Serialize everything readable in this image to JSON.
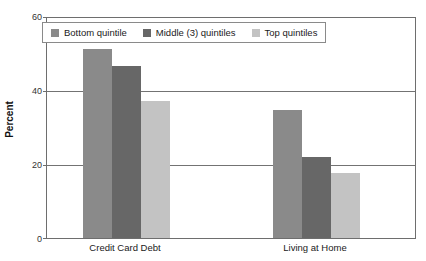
{
  "chart_data": {
    "type": "bar",
    "title": "",
    "subtitle": "",
    "xlabel": "",
    "ylabel": "Percent",
    "ylim": [
      0,
      60
    ],
    "yticks": [
      0,
      20,
      40,
      60
    ],
    "ytick_labels": [
      "0",
      "20",
      "40",
      "60"
    ],
    "grid": true,
    "grid_axis": "y",
    "legend_position": "upper left",
    "categories": [
      "Credit Card Debt",
      "Living at Home"
    ],
    "series": [
      {
        "name": "Bottom quintile",
        "color": "#8a8a8a",
        "values": [
          51,
          34.5
        ]
      },
      {
        "name": "Middle (3) quintiles",
        "color": "#676767",
        "values": [
          46.5,
          22
        ]
      },
      {
        "name": "Top quintiles",
        "color": "#c3c3c3",
        "values": [
          37,
          17.5
        ]
      }
    ]
  },
  "axes": {
    "y_title": "Percent",
    "tick_0": "0",
    "tick_20": "20",
    "tick_40": "40",
    "tick_60": "60"
  },
  "legend": {
    "item_0": "Bottom quintile",
    "item_1": "Middle (3) quintiles",
    "item_2": "Top quintiles"
  },
  "x_axis": {
    "category_0": "Credit Card Debt",
    "category_1": "Living at Home"
  },
  "colors": {
    "bottom_quintile": "#8a8a8a",
    "middle_quintiles": "#676767",
    "top_quintiles": "#c3c3c3",
    "axis": "#6e6e6e",
    "gridline": "#737373",
    "background": "#ffffff"
  }
}
